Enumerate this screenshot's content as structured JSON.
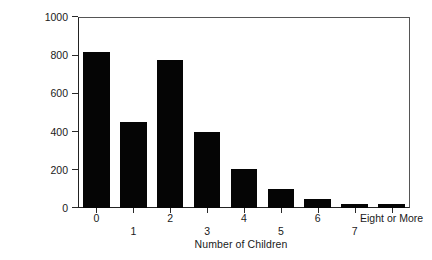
{
  "chart_data": {
    "type": "bar",
    "title": "",
    "xlabel": "Number of Children",
    "ylabel": "Frequency",
    "categories": [
      "0",
      "1",
      "2",
      "3",
      "4",
      "5",
      "6",
      "7",
      "Eight or More"
    ],
    "values": [
      815,
      450,
      775,
      400,
      205,
      100,
      48,
      22,
      20
    ],
    "ylim": [
      0,
      1000
    ],
    "yticks": [
      0,
      200,
      400,
      600,
      800,
      1000
    ],
    "ytick_labels": [
      "0",
      "200",
      "400",
      "600",
      "800",
      "1000"
    ],
    "grid": false,
    "legend": null,
    "bar_color": "#050505",
    "axis_color": "#222222",
    "background_color": "#ffffff",
    "tick_label_stagger": [
      "a",
      "b",
      "a",
      "b",
      "a",
      "b",
      "a",
      "b",
      "a"
    ]
  }
}
